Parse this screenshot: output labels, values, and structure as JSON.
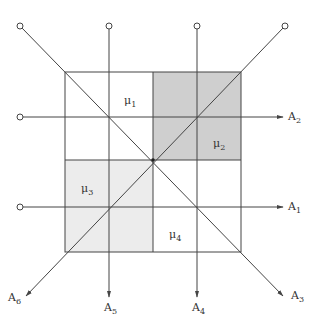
{
  "diagram": {
    "colors": {
      "line": "#444444",
      "dark_region": "#cfcfcf",
      "light_region": "#ececec",
      "background": "#ffffff"
    },
    "regions": [
      {
        "id": "mu1",
        "label": "μ",
        "sub": "1",
        "shade": "none"
      },
      {
        "id": "mu2",
        "label": "μ",
        "sub": "2",
        "shade": "dark"
      },
      {
        "id": "mu3",
        "label": "μ",
        "sub": "3",
        "shade": "light"
      },
      {
        "id": "mu4",
        "label": "μ",
        "sub": "4",
        "shade": "none"
      }
    ],
    "axes": [
      {
        "id": "A1",
        "label": "A",
        "sub": "1",
        "direction": "right"
      },
      {
        "id": "A2",
        "label": "A",
        "sub": "2",
        "direction": "right"
      },
      {
        "id": "A3",
        "label": "A",
        "sub": "3",
        "direction": "down-right"
      },
      {
        "id": "A4",
        "label": "A",
        "sub": "4",
        "direction": "down"
      },
      {
        "id": "A5",
        "label": "A",
        "sub": "5",
        "direction": "down"
      },
      {
        "id": "A6",
        "label": "A",
        "sub": "6",
        "direction": "down-left"
      }
    ]
  }
}
